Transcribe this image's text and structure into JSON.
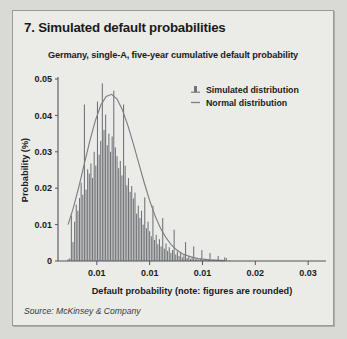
{
  "exhibit": {
    "title": "7. Simulated default probabilities"
  },
  "chart_subtitle": "Germany, single-A, five-year cumulative default probability",
  "source": {
    "note": "Source: McKinsey & Company"
  },
  "legend": {
    "position": "top-right",
    "items": [
      {
        "label": "Simulated distribution",
        "marker": "bar-marker-icon",
        "color": "#6f7276"
      },
      {
        "label": "Normal distribution",
        "marker": "line-marker-icon",
        "color": "#7c7f83"
      }
    ]
  },
  "colors": {
    "page_background": "#d9d9d6",
    "card_background": "#ebebe8",
    "card_border": "#9a9a97",
    "bar": "#6f7276",
    "curve": "#7c7f83",
    "axis": "#55555a",
    "text": "#1b1b1b"
  },
  "chart_data": {
    "type": "bar",
    "title": "Germany, single-A, five-year cumulative default probability",
    "xlabel": "Default probability (note: figures are rounded)",
    "ylabel": "Probability (%)",
    "grid": false,
    "legend_position": "top-right",
    "ylim": [
      0,
      0.05
    ],
    "ytick_labels": [
      "0",
      "0.01",
      "0.02",
      "0.03",
      "0.04",
      "0.05"
    ],
    "ytick_values": [
      0,
      0.01,
      0.02,
      0.03,
      0.04,
      0.05
    ],
    "xlim": [
      0.0,
      0.0345
    ],
    "xtick_labels": [
      "0.01",
      "0.01",
      "0.01",
      "0.02",
      "0.03"
    ],
    "xtick_values": [
      0.005,
      0.0118,
      0.0186,
      0.0254,
      0.0322
    ],
    "x_start": 0.0013,
    "x_step": 0.00021,
    "series": [
      {
        "name": "Simulated distribution",
        "type": "bar",
        "color": "#6f7276",
        "values": [
          0.0005,
          0.0007,
          0.0125,
          0.0052,
          0.0108,
          0.0155,
          0.0138,
          0.0173,
          0.0215,
          0.0182,
          0.043,
          0.0196,
          0.0252,
          0.024,
          0.0268,
          0.0228,
          0.03,
          0.0262,
          0.0438,
          0.0292,
          0.033,
          0.0488,
          0.036,
          0.0402,
          0.0318,
          0.035,
          0.03,
          0.0342,
          0.0468,
          0.0312,
          0.0288,
          0.0255,
          0.0275,
          0.0235,
          0.043,
          0.0262,
          0.0208,
          0.0228,
          0.019,
          0.0206,
          0.0172,
          0.0188,
          0.013,
          0.0152,
          0.0118,
          0.0138,
          0.01,
          0.0175,
          0.009,
          0.0108,
          0.0082,
          0.0068,
          0.0152,
          0.0058,
          0.0072,
          0.0046,
          0.006,
          0.004,
          0.0118,
          0.0034,
          0.0048,
          0.0028,
          0.0038,
          0.0022,
          0.003,
          0.0086,
          0.0018,
          0.0026,
          0.0014,
          0.0022,
          0.001,
          0.0016,
          0.0052,
          0.0008,
          0.0013,
          0.0006,
          0.001,
          0.004,
          0.0005,
          0.0009,
          0.0004,
          0.0007,
          0.003,
          0.0003,
          0.0006,
          0.0002,
          0.0005,
          0.0022,
          0.0002,
          0.0004,
          0.0001,
          0.0003,
          0.0014,
          0.0001,
          0.0002,
          0.0001,
          0.001,
          0.0008,
          0.0,
          0.0001
        ]
      },
      {
        "name": "Normal distribution",
        "type": "line",
        "color": "#7c7f83",
        "mean": 0.0072,
        "sigma": 0.0032,
        "peak": 0.0458,
        "points_x": [
          0.0013,
          0.002,
          0.0027,
          0.0034,
          0.0041,
          0.0048,
          0.0055,
          0.0062,
          0.0069,
          0.0076,
          0.0083,
          0.009,
          0.0097,
          0.0104,
          0.0111,
          0.0118,
          0.0125,
          0.0132,
          0.0139,
          0.0146,
          0.0153,
          0.016,
          0.017,
          0.018,
          0.0195,
          0.0215
        ],
        "points_y": [
          0.01,
          0.0148,
          0.0205,
          0.0268,
          0.033,
          0.0385,
          0.0428,
          0.0452,
          0.0458,
          0.0445,
          0.0415,
          0.0372,
          0.0322,
          0.0268,
          0.0215,
          0.0166,
          0.0124,
          0.009,
          0.0064,
          0.0044,
          0.003,
          0.002,
          0.0012,
          0.0007,
          0.0003,
          0.0001
        ]
      }
    ]
  }
}
